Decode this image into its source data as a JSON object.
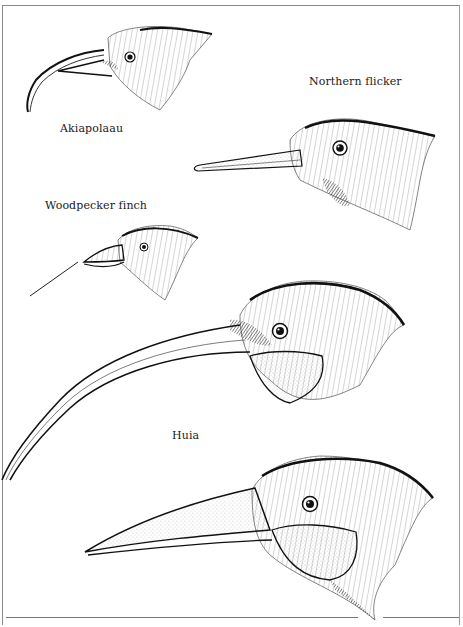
{
  "plate": {
    "style": "black-and-white pen-and-ink illustration",
    "colors": {
      "ink": "#1a1a1a",
      "paper": "#ffffff",
      "frame": "#8a8a8a"
    },
    "birds": [
      {
        "id": "akiapolaau",
        "label": "Akiapolaau"
      },
      {
        "id": "northern-flicker",
        "label": "Northern flicker"
      },
      {
        "id": "woodpecker-finch",
        "label": "Woodpecker finch"
      },
      {
        "id": "huia-female",
        "label": "Huia"
      },
      {
        "id": "huia-male",
        "label": ""
      }
    ]
  }
}
